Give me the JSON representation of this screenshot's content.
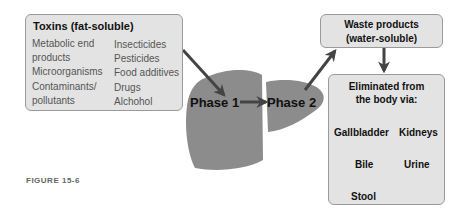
{
  "toxins": {
    "title": "Toxins (fat-soluble)",
    "left_items": [
      "Metabolic end",
      "products",
      "Microorganisms",
      "Contaminants/",
      "pollutants"
    ],
    "right_items": [
      "Insecticides",
      "Pesticides",
      "Food additives",
      "Drugs",
      "Alchohol"
    ]
  },
  "liver": {
    "phase1": "Phase 1",
    "phase2": "Phase 2"
  },
  "waste": {
    "line1": "Waste products",
    "line2": "(water-soluble)"
  },
  "elimination": {
    "title_line1": "Eliminated from",
    "title_line2": "the body via:",
    "routes": {
      "gallbladder": "Gallbladder",
      "bile": "Bile",
      "stool": "Stool",
      "kidneys": "Kidneys",
      "urine": "Urine"
    }
  },
  "caption": "FIGURE 15-6",
  "colors": {
    "box_fill": "#e3e3e3",
    "liver_fill": "#8c8c8c",
    "arrow": "#444444"
  }
}
